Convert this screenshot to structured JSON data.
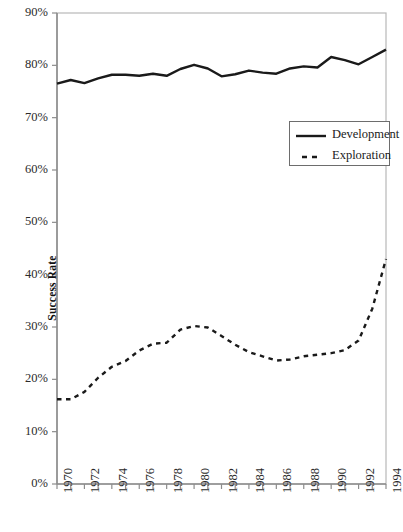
{
  "chart_data": {
    "type": "line",
    "title": "",
    "xlabel": "",
    "ylabel": "Success Rate",
    "xlim": [
      1970,
      1994
    ],
    "ylim": [
      0,
      90
    ],
    "y_unit": "%",
    "grid": false,
    "legend_position": "upper-right-inside",
    "ytick_labels": [
      "90%",
      "80%",
      "70%",
      "60%",
      "50%",
      "40%",
      "30%",
      "20%",
      "10%",
      "0%"
    ],
    "ytick_values": [
      90,
      80,
      70,
      60,
      50,
      40,
      30,
      20,
      10,
      0
    ],
    "xtick_labels": [
      "1970",
      "1972",
      "1974",
      "1976",
      "1978",
      "1980",
      "1982",
      "1984",
      "1986",
      "1988",
      "1990",
      "1992",
      "1994"
    ],
    "xtick_values": [
      1970,
      1972,
      1974,
      1976,
      1978,
      1980,
      1982,
      1984,
      1986,
      1988,
      1990,
      1992,
      1994
    ],
    "x": [
      1970,
      1971,
      1972,
      1973,
      1974,
      1975,
      1976,
      1977,
      1978,
      1979,
      1980,
      1981,
      1982,
      1983,
      1984,
      1985,
      1986,
      1987,
      1988,
      1989,
      1990,
      1991,
      1992,
      1993,
      1994
    ],
    "series": [
      {
        "name": "Development",
        "style": "solid",
        "color": "#1a1a1a",
        "values": [
          76.5,
          77.2,
          76.6,
          77.5,
          78.2,
          78.2,
          78.0,
          78.4,
          78.0,
          79.3,
          80.1,
          79.4,
          77.9,
          78.3,
          79.0,
          78.6,
          78.4,
          79.4,
          79.8,
          79.6,
          81.6,
          81.0,
          80.2,
          81.6,
          83.0
        ]
      },
      {
        "name": "Exploration",
        "style": "dashed",
        "color": "#1a1a1a",
        "values": [
          16.2,
          16.2,
          17.6,
          20.3,
          22.4,
          23.5,
          25.5,
          26.8,
          27.0,
          29.5,
          30.2,
          29.9,
          28.3,
          26.6,
          25.2,
          24.4,
          23.6,
          23.8,
          24.4,
          24.7,
          25.0,
          25.6,
          27.4,
          33.5,
          43.0
        ]
      }
    ],
    "legend": [
      {
        "label": "Development",
        "style": "solid"
      },
      {
        "label": "Exploration",
        "style": "dashed"
      }
    ]
  },
  "caption": {
    "text": ""
  }
}
